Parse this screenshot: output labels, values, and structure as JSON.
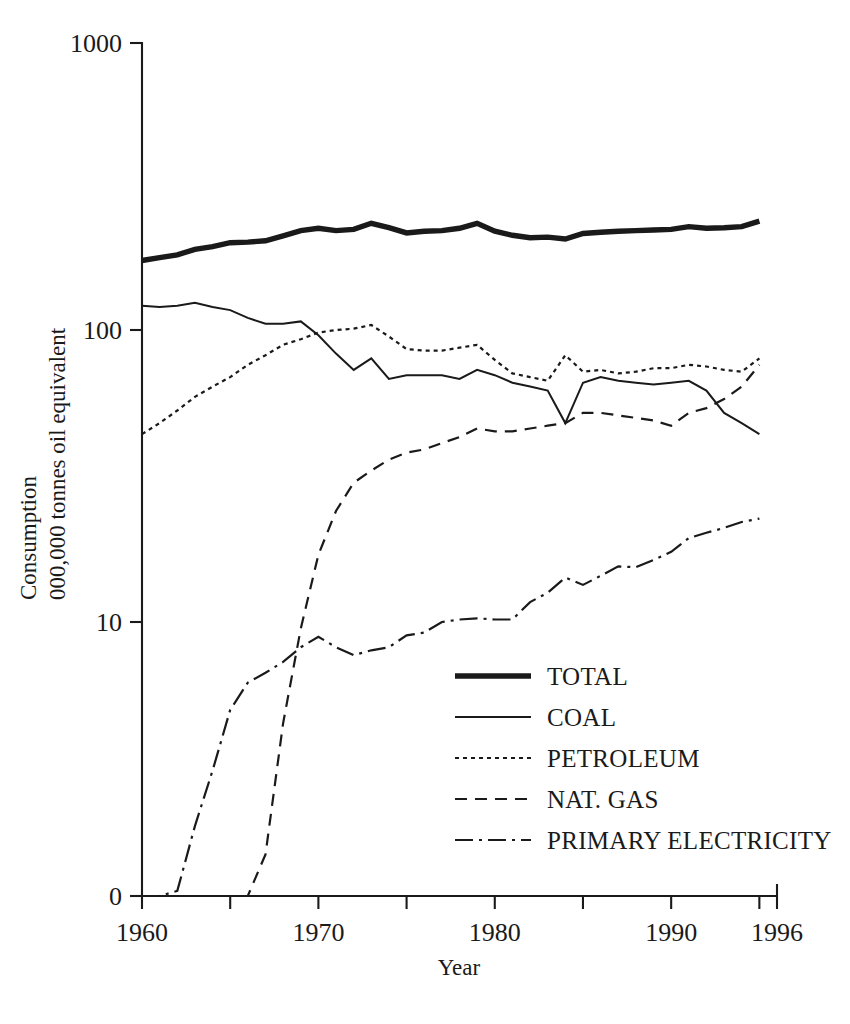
{
  "chart_data": {
    "type": "line",
    "title": "",
    "xlabel": "Year",
    "ylabel": "Consumption\n000,000 tonnes oil equivalent",
    "ylabel_line1": "Consumption",
    "ylabel_line2": "000,000 tonnes oil equivalent",
    "yscale": "log",
    "ylim": [
      1,
      1000
    ],
    "ytick_labels": [
      "1000",
      "100",
      "10",
      "0"
    ],
    "ytick_values": [
      1000,
      100,
      10,
      0
    ],
    "xlim": [
      1960,
      1996
    ],
    "xtick_labels": [
      "1960",
      "1970",
      "1980",
      "1990",
      "1996"
    ],
    "xtick_values": [
      1960,
      1970,
      1980,
      1990,
      1996
    ],
    "xminor_ticks": [
      1965,
      1975,
      1985,
      1995
    ],
    "grid": false,
    "legend_position": "lower-right",
    "x": [
      1960,
      1961,
      1962,
      1963,
      1964,
      1965,
      1966,
      1967,
      1968,
      1969,
      1970,
      1971,
      1972,
      1973,
      1974,
      1975,
      1976,
      1977,
      1978,
      1979,
      1980,
      1981,
      1982,
      1983,
      1984,
      1985,
      1986,
      1987,
      1988,
      1989,
      1990,
      1991,
      1992,
      1993,
      1994,
      1995
    ],
    "series": [
      {
        "name": "TOTAL",
        "style": "solid-thick",
        "stroke_width": 5.4,
        "dash": "none",
        "values": [
          173,
          177,
          181,
          189,
          193,
          199,
          200,
          202,
          210,
          219,
          223,
          219,
          221,
          232,
          224,
          215,
          218,
          219,
          223,
          232,
          218,
          211,
          207,
          208,
          205,
          214,
          216,
          218,
          219,
          220,
          221,
          226,
          223,
          224,
          226,
          236
        ]
      },
      {
        "name": "COAL",
        "style": "solid-thin",
        "stroke_width": 2.0,
        "dash": "none",
        "values": [
          121,
          120,
          121,
          124,
          120,
          117,
          110,
          105,
          105,
          107,
          96,
          83,
          73,
          80,
          68,
          70,
          70,
          70,
          68,
          73,
          70,
          66,
          64,
          62,
          48,
          66,
          69,
          67,
          66,
          65,
          66,
          67,
          62,
          52,
          48,
          44
        ]
      },
      {
        "name": "PETROLEUM",
        "style": "dotted",
        "stroke_width": 2.2,
        "dash": "4,4",
        "values": [
          44,
          48,
          53,
          59,
          64,
          69,
          76,
          82,
          89,
          93,
          98,
          100,
          101,
          104,
          95,
          86,
          85,
          85,
          87,
          89,
          79,
          71,
          69,
          67,
          82,
          72,
          73,
          71,
          72,
          74,
          74,
          76,
          75,
          73,
          72,
          80
        ]
      },
      {
        "name": "NAT. GAS",
        "style": "dashed",
        "stroke_width": 2.2,
        "dash": "12,8",
        "values": [
          0.02,
          0.03,
          0.04,
          0.05,
          0.07,
          0.1,
          0.5,
          1.6,
          4.5,
          9.5,
          17,
          24,
          30,
          33,
          36,
          38,
          39,
          41,
          43,
          46,
          45,
          45,
          46,
          47,
          48,
          52,
          52,
          51,
          50,
          49,
          47,
          52,
          54,
          58,
          64,
          76
        ]
      },
      {
        "name": "PRIMARY ELECTRICITY",
        "style": "dash-dot",
        "stroke_width": 2.2,
        "dash": "18,6,3,6",
        "values": [
          0.25,
          0.6,
          1.2,
          2.0,
          3.1,
          5.0,
          6.2,
          6.7,
          7.3,
          8.2,
          8.9,
          8.2,
          7.7,
          8.0,
          8.2,
          9.0,
          9.2,
          10.0,
          10.2,
          10.3,
          10.2,
          10.2,
          11.7,
          12.6,
          14.2,
          13.4,
          14.4,
          15.5,
          15.4,
          16.3,
          17.4,
          19.4,
          20.2,
          21.0,
          22.0,
          22.6
        ]
      }
    ]
  },
  "legend": {
    "items": [
      {
        "label": "TOTAL",
        "style": "solid-thick"
      },
      {
        "label": "COAL",
        "style": "solid-thin"
      },
      {
        "label": "PETROLEUM",
        "style": "dotted"
      },
      {
        "label": "NAT. GAS",
        "style": "dashed"
      },
      {
        "label": "PRIMARY ELECTRICITY",
        "style": "dash-dot"
      }
    ]
  },
  "colors": {
    "ink": "#1a1a1a",
    "background": "#ffffff"
  }
}
